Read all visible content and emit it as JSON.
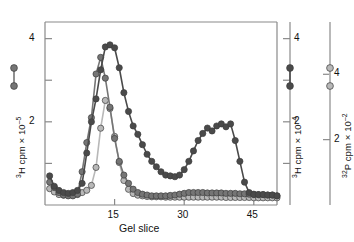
{
  "figure": {
    "background": "#ffffff",
    "xlabel": "Gel slice",
    "xticks": [
      15,
      30,
      45
    ],
    "xtick_labels": [
      "15",
      "30",
      "45"
    ],
    "xlim": [
      0,
      50
    ],
    "axes": [
      {
        "id": "left",
        "label_parts": {
          "pre": "3",
          "text": "H cpm × 10",
          "exp": "–5"
        },
        "label_full": "³H cpm × 10⁻⁵",
        "ticks": [
          0,
          1,
          2,
          3,
          4
        ],
        "tick_labels": [
          "",
          "",
          "2",
          "",
          "4"
        ],
        "ylim": [
          0,
          4.4
        ],
        "series_color": "#757575"
      },
      {
        "id": "middle",
        "label_parts": {
          "pre": "3",
          "text": "H cpm × 10",
          "exp": "–4"
        },
        "label_full": "³H cpm × 10⁻⁴",
        "ticks": [
          0,
          1,
          2,
          3,
          4
        ],
        "tick_labels": [
          "",
          "",
          "2",
          "",
          "4"
        ],
        "ylim": [
          0,
          4.4
        ],
        "series_color": "#4a4a4a"
      },
      {
        "id": "right",
        "label_parts": {
          "pre": "32",
          "text": "P cpm × 10",
          "exp": "–2"
        },
        "label_full": "³²P cpm × 10⁻²",
        "ticks": [
          0,
          2,
          4
        ],
        "tick_labels": [
          "",
          "2",
          "4"
        ],
        "ylim": [
          0,
          5.6
        ],
        "series_color": "#b8b8b8"
      }
    ],
    "legend_markers": [
      {
        "name": "legend-marker-left",
        "color": "#757575"
      },
      {
        "name": "legend-marker-middle",
        "color": "#4a4a4a"
      },
      {
        "name": "legend-marker-right",
        "color": "#b8b8b8"
      }
    ]
  },
  "chart_data": {
    "type": "scatter",
    "title": "",
    "xlabel": "Gel slice",
    "ylabel": "³H cpm × 10⁻⁵ / ³H cpm × 10⁻⁴ / ³²P cpm × 10⁻²",
    "xlim": [
      0,
      50
    ],
    "xticks": [
      15,
      30,
      45
    ],
    "grid": false,
    "legend": "none",
    "marker": "filled-circle",
    "connected": true,
    "series": [
      {
        "name": "3H cpm x 10-5 (medium gray)",
        "axis": "left",
        "color": "#757575",
        "ylim": [
          0,
          4.4
        ],
        "x": [
          1,
          2,
          3,
          4,
          5,
          6,
          7,
          8,
          9,
          10,
          11,
          12,
          13,
          14,
          15,
          16,
          17,
          18,
          19,
          20,
          21,
          22,
          23,
          24,
          25,
          26,
          27,
          28,
          29,
          30,
          31,
          32,
          33,
          34,
          35,
          36,
          37,
          38,
          39,
          40,
          41,
          42,
          43,
          44,
          45,
          46,
          47,
          48,
          49,
          50
        ],
        "y": [
          0.55,
          0.42,
          0.3,
          0.24,
          0.22,
          0.22,
          0.26,
          0.8,
          1.5,
          2.1,
          3.15,
          3.55,
          3.05,
          2.35,
          1.6,
          1.05,
          0.72,
          0.52,
          0.38,
          0.3,
          0.26,
          0.24,
          0.22,
          0.22,
          0.22,
          0.22,
          0.23,
          0.24,
          0.26,
          0.28,
          0.3,
          0.3,
          0.3,
          0.3,
          0.29,
          0.29,
          0.29,
          0.29,
          0.28,
          0.28,
          0.28,
          0.27,
          0.27,
          0.26,
          0.26,
          0.25,
          0.25,
          0.24,
          0.24,
          0.22
        ]
      },
      {
        "name": "3H cpm x 10-4 (dark gray)",
        "axis": "middle",
        "color": "#4a4a4a",
        "ylim": [
          0,
          4.4
        ],
        "x": [
          1,
          2,
          3,
          4,
          5,
          6,
          7,
          8,
          9,
          10,
          11,
          12,
          13,
          14,
          15,
          16,
          17,
          18,
          19,
          20,
          21,
          22,
          23,
          24,
          25,
          26,
          27,
          28,
          29,
          30,
          31,
          32,
          33,
          34,
          35,
          36,
          37,
          38,
          39,
          40,
          41,
          42,
          43,
          44,
          45,
          46,
          47,
          48,
          49,
          50
        ],
        "y": [
          0.7,
          0.45,
          0.35,
          0.3,
          0.28,
          0.3,
          0.35,
          0.52,
          1.25,
          2.0,
          2.55,
          3.25,
          3.8,
          3.85,
          3.78,
          3.3,
          2.7,
          2.25,
          1.9,
          1.7,
          1.45,
          1.22,
          1.05,
          0.92,
          0.8,
          0.72,
          0.7,
          0.68,
          0.72,
          0.85,
          1.05,
          1.3,
          1.55,
          1.72,
          1.85,
          1.78,
          1.9,
          1.95,
          1.88,
          1.95,
          1.55,
          1.05,
          0.55,
          0.3,
          0.25,
          0.25,
          0.25,
          0.24,
          0.24,
          0.22
        ]
      },
      {
        "name": "32P cpm x 10-2 (light gray)",
        "axis": "right",
        "color": "#b8b8b8",
        "ylim": [
          0,
          5.6
        ],
        "x": [
          1,
          2,
          3,
          4,
          5,
          6,
          7,
          8,
          9,
          10,
          11,
          12,
          13,
          14,
          15,
          16,
          17,
          18,
          19,
          20,
          21,
          22,
          23,
          24,
          25,
          26,
          27,
          28,
          29,
          30,
          31,
          32,
          33,
          34,
          35,
          36,
          37,
          38,
          39,
          40,
          41,
          42,
          43,
          44,
          45,
          46,
          47,
          48,
          49,
          50
        ],
        "y": [
          0.5,
          0.4,
          0.32,
          0.3,
          0.3,
          0.3,
          0.32,
          0.38,
          0.45,
          0.6,
          1.15,
          2.35,
          3.2,
          2.95,
          2.1,
          1.3,
          0.75,
          0.48,
          0.35,
          0.3,
          0.28,
          0.26,
          0.25,
          0.25,
          0.25,
          0.24,
          0.24,
          0.24,
          0.24,
          0.24,
          0.24,
          0.24,
          0.24,
          0.24,
          0.24,
          0.24,
          0.24,
          0.24,
          0.23,
          0.23,
          0.23,
          0.23,
          0.23,
          0.23,
          0.22,
          0.22,
          0.22,
          0.22,
          0.22,
          0.22
        ]
      }
    ]
  }
}
